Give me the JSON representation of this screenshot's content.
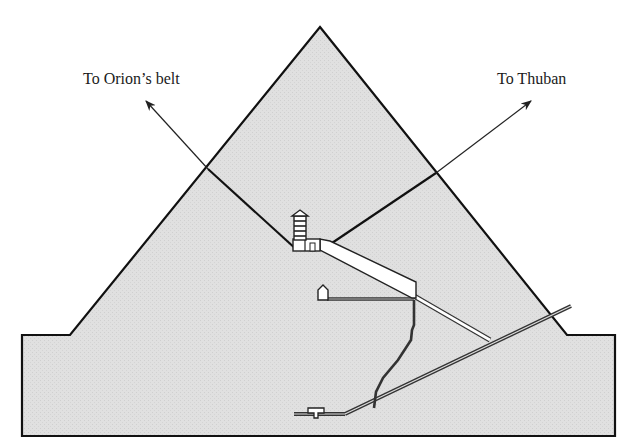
{
  "diagram": {
    "labels": {
      "orion": "To Orion’s belt",
      "thuban": "To Thuban"
    },
    "colors": {
      "background": "#ffffff",
      "pyramid_fill": "#dedede",
      "outline": "#111111",
      "passage_fill": "#ffffff",
      "passage_line": "#333333"
    },
    "elements": [
      "pyramid-outline",
      "base-platform",
      "orion-shaft",
      "thuban-shaft",
      "kings-chamber",
      "relieving-chambers",
      "grand-gallery",
      "queens-chamber",
      "horizontal-passage",
      "ascending-passage",
      "descending-passage",
      "well-shaft",
      "subterranean-chamber"
    ]
  }
}
